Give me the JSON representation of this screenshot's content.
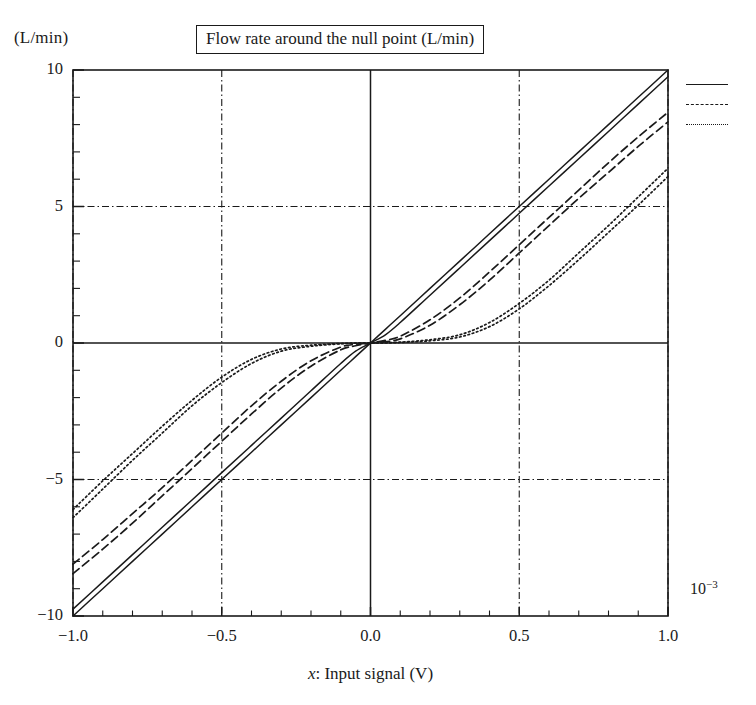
{
  "figure": {
    "title": "Flow rate around the null point (L/min)",
    "y_unit_label": "(L/min)",
    "x_axis_title_italic": "x",
    "x_axis_title_rest": ": Input signal (V)",
    "exponent_base": "10",
    "exponent_power": "−3",
    "axis_color": "#1a1a1a",
    "background_color": "#ffffff"
  },
  "legend": {
    "position": "right-top-outside",
    "entries": [
      {
        "style": "solid",
        "label": ""
      },
      {
        "style": "dashed",
        "label": ""
      },
      {
        "style": "dotted",
        "label": ""
      }
    ]
  },
  "chart_data": {
    "type": "line",
    "title": "Flow rate around the null point (L/min)",
    "xlabel": "x: Input signal (V)",
    "ylabel": "(L/min)",
    "xlim": [
      -1.0,
      1.0
    ],
    "ylim": [
      -10,
      10
    ],
    "xticks": [
      "-1.0",
      "-0.5",
      "0.0",
      "0.5",
      "1.0"
    ],
    "xtick_values": [
      -1.0,
      -0.5,
      0.0,
      0.5,
      1.0
    ],
    "yticks": [
      "10",
      "5",
      "0",
      "-5",
      "-10"
    ],
    "ytick_values": [
      10,
      5,
      0,
      -5,
      -10
    ],
    "x_minor_tick_step": 0.1,
    "y_minor_tick_step": 1,
    "grid": "dash-dot gridlines at x = -0.5, 0.5 and y = -5, 5; solid axis lines at x = 0 and y = 0",
    "y_scale_note": "10^-3",
    "x": [
      -1.0,
      -0.9,
      -0.8,
      -0.7,
      -0.6,
      -0.5,
      -0.4,
      -0.3,
      -0.2,
      -0.1,
      -0.05,
      0.0,
      0.05,
      0.1,
      0.2,
      0.3,
      0.4,
      0.5,
      0.6,
      0.7,
      0.8,
      0.9,
      1.0
    ],
    "series": [
      {
        "name": "zero-lap (solid, up)",
        "style": "solid",
        "values": [
          -10.0,
          -9.0,
          -8.0,
          -7.0,
          -6.0,
          -5.0,
          -4.0,
          -3.0,
          -2.0,
          -1.0,
          -0.5,
          0.0,
          0.5,
          1.0,
          2.0,
          3.0,
          4.0,
          5.0,
          6.0,
          7.0,
          8.0,
          9.0,
          10.0
        ]
      },
      {
        "name": "zero-lap (solid, down)",
        "style": "solid",
        "values": [
          -9.75,
          -8.75,
          -7.75,
          -6.75,
          -5.75,
          -4.75,
          -3.75,
          -2.75,
          -1.75,
          -0.75,
          -0.3,
          0.0,
          0.3,
          0.75,
          1.75,
          2.75,
          3.75,
          4.75,
          5.75,
          6.75,
          7.75,
          8.75,
          9.75
        ]
      },
      {
        "name": "overlapped (dashed, up)",
        "style": "dashed",
        "values": [
          -8.45,
          -7.55,
          -6.6,
          -5.6,
          -4.6,
          -3.6,
          -2.6,
          -1.65,
          -0.85,
          -0.25,
          -0.1,
          0.0,
          0.1,
          0.25,
          0.85,
          1.65,
          2.6,
          3.6,
          4.6,
          5.6,
          6.6,
          7.55,
          8.45
        ]
      },
      {
        "name": "overlapped (dashed, down)",
        "style": "dashed",
        "values": [
          -8.1,
          -7.2,
          -6.25,
          -5.3,
          -4.3,
          -3.3,
          -2.3,
          -1.4,
          -0.65,
          -0.15,
          -0.05,
          0.0,
          0.05,
          0.15,
          0.65,
          1.4,
          2.3,
          3.3,
          4.3,
          5.3,
          6.25,
          7.2,
          8.1
        ]
      },
      {
        "name": "deadband (dotted, up)",
        "style": "dotted",
        "values": [
          -6.4,
          -5.35,
          -4.3,
          -3.3,
          -2.3,
          -1.45,
          -0.75,
          -0.3,
          -0.12,
          -0.03,
          -0.01,
          0.0,
          0.01,
          0.03,
          0.12,
          0.3,
          0.75,
          1.45,
          2.3,
          3.3,
          4.3,
          5.35,
          6.4
        ]
      },
      {
        "name": "deadband (dotted, down)",
        "style": "dotted",
        "values": [
          -6.1,
          -5.05,
          -4.05,
          -3.05,
          -2.1,
          -1.25,
          -0.6,
          -0.22,
          -0.08,
          -0.02,
          -0.005,
          0.0,
          0.005,
          0.02,
          0.08,
          0.22,
          0.6,
          1.25,
          2.1,
          3.05,
          4.05,
          5.05,
          6.1
        ]
      }
    ]
  }
}
